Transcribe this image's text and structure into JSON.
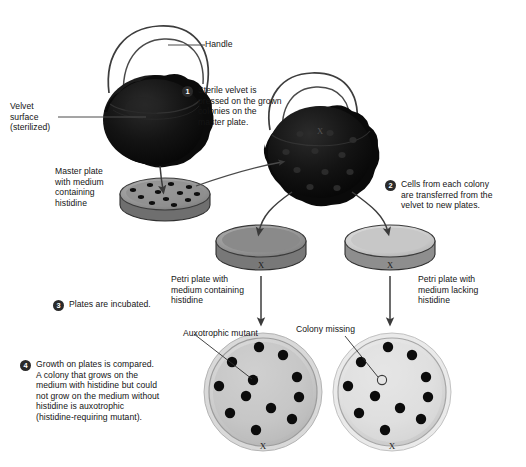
{
  "figure": {
    "background_color": "#ffffff",
    "badge_color": "#2a2a2a",
    "colony_color": "#111111",
    "velvet_color": "#0d0d0d"
  },
  "labels": {
    "handle": "Handle",
    "velvet_surface": "Velvet\nsurface\n(sterilized)",
    "master_plate": "Master plate\nwith medium\ncontaining\nhistidine",
    "petri_with_histidine": "Petri plate with\nmedium containing\nhistidine",
    "petri_lacking_histidine": "Petri plate with\nmedium lacking\nhistidine",
    "auxotrophic_mutant": "Auxotrophic mutant",
    "colony_missing": "Colony missing",
    "plate_mark": "X"
  },
  "steps": [
    {
      "number": "1",
      "text": "Sterile velvet is\npressed on the grown\ncolonies on the\nmaster plate."
    },
    {
      "number": "2",
      "text": "Cells from each colony\nare transferred from the\nvelvet to new plates."
    },
    {
      "number": "3",
      "text": "Plates are incubated."
    },
    {
      "number": "4",
      "text": "Growth on plates is compared.\nA colony that grows on the\nmedium with histidine but could\nnot grow on the medium without\nhistidine is auxotrophic\n(histidine-requiring mutant)."
    }
  ],
  "plates": {
    "master": {
      "name": "master-plate",
      "colony_count": 12,
      "medium": "containing histidine"
    },
    "incubate_left": {
      "name": "fresh-plate-with-histidine",
      "colony_count": 0,
      "medium": "containing histidine"
    },
    "incubate_right": {
      "name": "fresh-plate-lacking-histidine",
      "colony_count": 0,
      "medium": "lacking histidine"
    },
    "result_left": {
      "name": "result-plate-with-histidine",
      "colony_count": 12,
      "missing_colony": false,
      "medium": "containing histidine"
    },
    "result_right": {
      "name": "result-plate-lacking-histidine",
      "colony_count": 11,
      "missing_colony": true,
      "medium": "lacking histidine"
    }
  }
}
